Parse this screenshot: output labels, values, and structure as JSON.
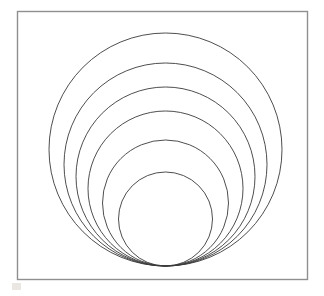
{
  "figure": {
    "background_color": "#ffffff",
    "canvas": {
      "width": 324,
      "height": 296
    },
    "frame": {
      "label": "figure-border",
      "x": 17.5,
      "y": 11.5,
      "width": 290,
      "height": 268,
      "stroke_color": "#8f8f8f",
      "stroke_width": 1.4,
      "fill": "#ffffff"
    },
    "artifact": {
      "label": "scan-artifact",
      "x": 12,
      "y": 283,
      "width": 9,
      "height": 7,
      "color": "#d8d4cc"
    }
  },
  "chart_data": {
    "type": "scatter",
    "subtitle": "",
    "xlabel": "",
    "ylabel": "",
    "xlim": [
      17,
      308
    ],
    "ylim": [
      11,
      280
    ],
    "grid": false,
    "legend": null,
    "annotations": [],
    "tangent_point": {
      "x": 165.5,
      "y": 266.0
    },
    "common_center_x": 165.5,
    "stroke_color": "#3a3a3a",
    "stroke_width": 0.9,
    "fill": "none",
    "series": [
      {
        "name": "circle-1-outermost",
        "cx": 165.5,
        "cy": 149.5,
        "r": 116.5,
        "top_y": 33.0,
        "bottom_y": 266.0,
        "left_x": 49.0,
        "right_x": 282.0
      },
      {
        "name": "circle-2",
        "cx": 165.5,
        "cy": 164.5,
        "r": 101.5,
        "top_y": 63.0,
        "bottom_y": 266.0,
        "left_x": 64.0,
        "right_x": 267.0
      },
      {
        "name": "circle-3",
        "cx": 165.5,
        "cy": 176.5,
        "r": 89.5,
        "top_y": 87.0,
        "bottom_y": 266.0,
        "left_x": 76.0,
        "right_x": 255.0
      },
      {
        "name": "circle-4",
        "cx": 165.5,
        "cy": 188.5,
        "r": 77.5,
        "top_y": 111.0,
        "bottom_y": 266.0,
        "left_x": 88.0,
        "right_x": 243.0
      },
      {
        "name": "circle-5",
        "cx": 165.5,
        "cy": 203.0,
        "r": 63.0,
        "top_y": 140.0,
        "bottom_y": 266.0,
        "left_x": 102.5,
        "right_x": 228.5
      },
      {
        "name": "circle-6-innermost",
        "cx": 165.5,
        "cy": 219.0,
        "r": 47.0,
        "top_y": 172.0,
        "bottom_y": 266.0,
        "left_x": 118.5,
        "right_x": 212.5
      }
    ]
  }
}
